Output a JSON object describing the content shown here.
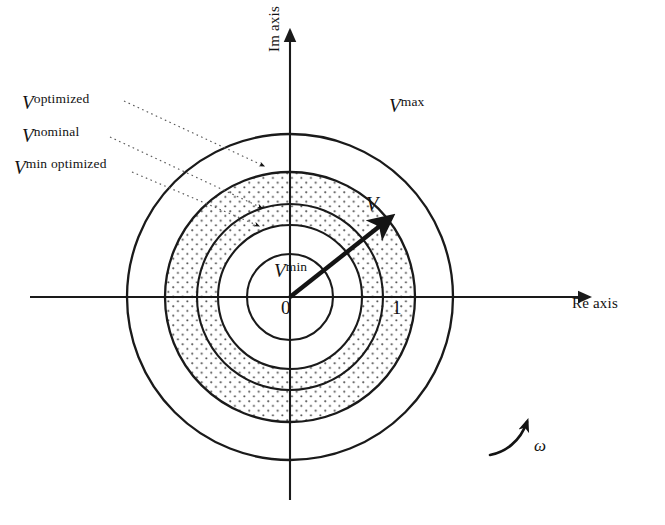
{
  "figure": {
    "center": {
      "x": 290,
      "y": 297
    },
    "axes": {
      "imaginary": {
        "label": "Im axis",
        "orientation": "vertical",
        "arrow": "up"
      },
      "real": {
        "label": "Re axis",
        "orientation": "horizontal",
        "arrow": "right"
      }
    },
    "origin_label": "0",
    "unit_tick_label": "1",
    "rotation_marker": {
      "symbol": "ω",
      "name": "omega",
      "direction": "counterclockwise"
    },
    "vector": {
      "label": "V",
      "name": "voltage-phasor",
      "tip": {
        "x": 390,
        "y": 218
      },
      "angle_deg": 38
    },
    "circles": [
      {
        "name": "v-min",
        "label": "V",
        "superscript": "min",
        "radius": 43,
        "in_figure_label": true
      },
      {
        "name": "v-min-optimized",
        "label": "V",
        "superscript": "min optimized",
        "radius": 72,
        "in_figure_label": false
      },
      {
        "name": "v-nominal",
        "label": "V",
        "superscript": "nominal",
        "radius": 93,
        "in_figure_label": false
      },
      {
        "name": "v-optimized",
        "label": "V",
        "superscript": "optimized",
        "radius": 125,
        "in_figure_label": false
      },
      {
        "name": "v-max",
        "label": "V",
        "superscript": "max",
        "radius": 163,
        "in_figure_label": true
      }
    ],
    "shaded_band": {
      "inner_radius": 72,
      "outer_radius": 125,
      "fill": "dotted-stipple"
    },
    "callouts": [
      {
        "name": "callout-optimized",
        "label": "V",
        "superscript": "optimized",
        "target": {
          "x": 268,
          "y": 163
        }
      },
      {
        "name": "callout-nominal",
        "label": "V",
        "superscript": "nominal",
        "target": {
          "x": 266,
          "y": 205
        }
      },
      {
        "name": "callout-min-optimized",
        "label": "V",
        "superscript": "min optimized",
        "target": {
          "x": 263,
          "y": 223
        }
      }
    ],
    "colors": {
      "stroke": "#1a1a1a",
      "background": "#ffffff",
      "stipple_dot": "#4a4a4a",
      "leader_line": "#5a5a5a"
    }
  }
}
